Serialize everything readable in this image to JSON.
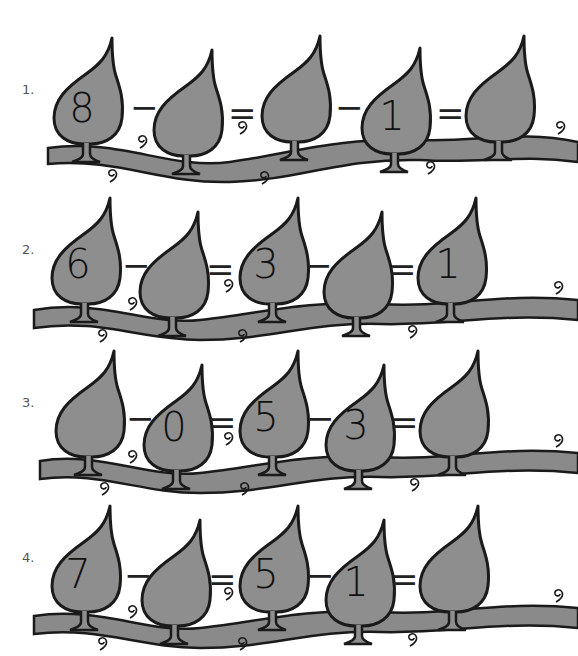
{
  "worksheet": {
    "title": "",
    "colors": {
      "leaf": "#8e8e8e",
      "outline": "#1a1a1a",
      "vine": "#8a8a8a",
      "background": "#ffffff"
    },
    "rows": [
      {
        "label": "1.",
        "leaves": [
          "8",
          "",
          "",
          "1",
          ""
        ],
        "ops": [
          "−",
          "=",
          "−",
          "="
        ]
      },
      {
        "label": "2.",
        "leaves": [
          "6",
          "",
          "3",
          "",
          "1"
        ],
        "ops": [
          "−",
          "=",
          "−",
          "="
        ]
      },
      {
        "label": "3.",
        "leaves": [
          "",
          "0",
          "5",
          "3",
          ""
        ],
        "ops": [
          "−",
          "=",
          "−",
          "="
        ]
      },
      {
        "label": "4.",
        "leaves": [
          "7",
          "",
          "5",
          "1",
          ""
        ],
        "ops": [
          "−",
          "=",
          "−",
          "="
        ]
      }
    ]
  }
}
